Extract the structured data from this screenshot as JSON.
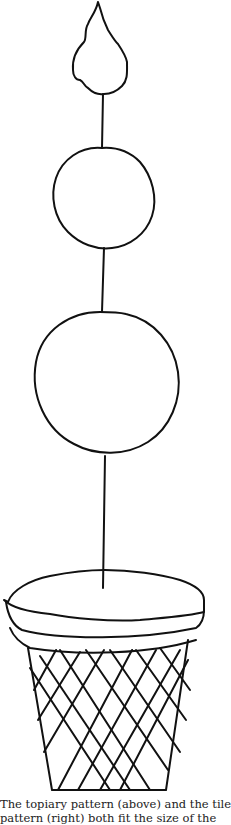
{
  "illustration": {
    "subject": "topiary-pattern",
    "parts": [
      "teardrop-top",
      "upper-sphere",
      "lower-sphere",
      "stem",
      "soil-mound",
      "woven-basket-pot"
    ],
    "stroke_color": "#111111",
    "background_color": "#ffffff"
  },
  "caption": {
    "line1": "The topiary pattern (above) and the tile",
    "line2": "pattern (right) both fit the size of the"
  }
}
